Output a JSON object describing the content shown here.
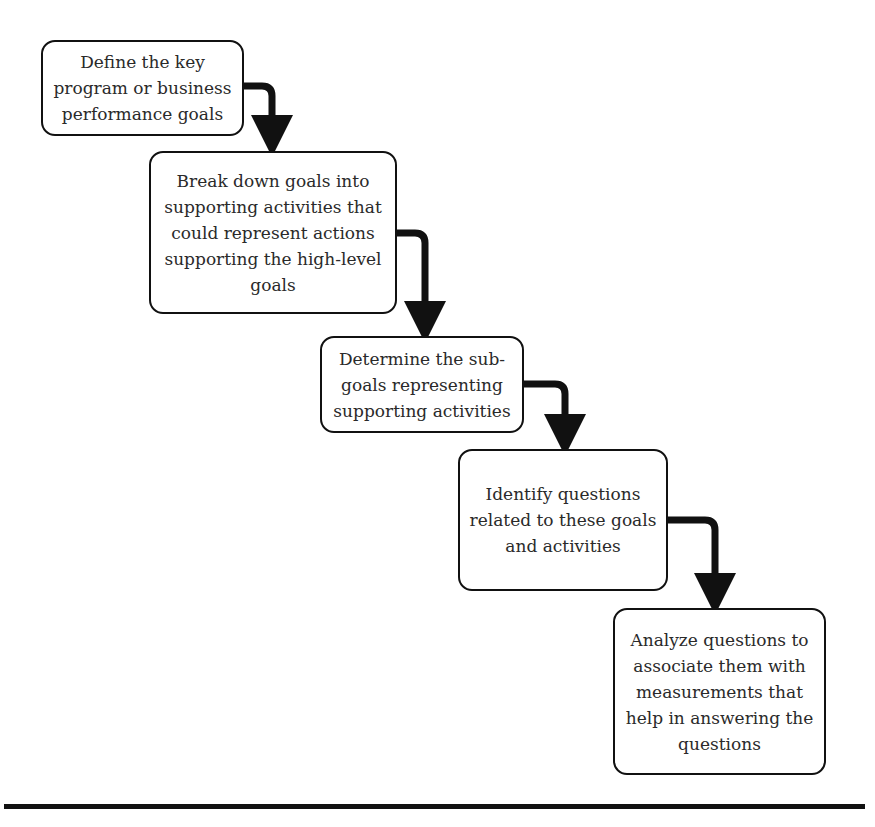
{
  "steps": [
    {
      "id": 1,
      "text": "Define the key program or business performance goals",
      "lines": [
        "Define the key",
        "program or business",
        "performance goals"
      ]
    },
    {
      "id": 2,
      "text": "Break down goals into supporting activities that could represent actions supporting the high-level goals",
      "lines": [
        "Break down goals into",
        "supporting activities that",
        "could represent actions",
        "supporting the high-level",
        "goals"
      ]
    },
    {
      "id": 3,
      "text": "Determine the sub-goals representing supporting activities",
      "lines": [
        "Determine the sub-",
        "goals representing",
        "supporting activities"
      ]
    },
    {
      "id": 4,
      "text": "Identify questions related to these goals and activities",
      "lines": [
        "Identify questions",
        "related to these goals",
        "and activities"
      ]
    },
    {
      "id": 5,
      "text": "Analyze questions to associate them with measurements that help in answering the questions",
      "lines": [
        "Analyze questions to",
        "associate them with",
        "measurements that",
        "help in answering the",
        "questions"
      ]
    }
  ],
  "connectors": [
    {
      "from": 1,
      "to": 2
    },
    {
      "from": 2,
      "to": 3
    },
    {
      "from": 3,
      "to": 4
    },
    {
      "from": 4,
      "to": 5
    }
  ],
  "colors": {
    "stroke": "#111111",
    "text": "#2a2a2a",
    "background": "#ffffff"
  }
}
